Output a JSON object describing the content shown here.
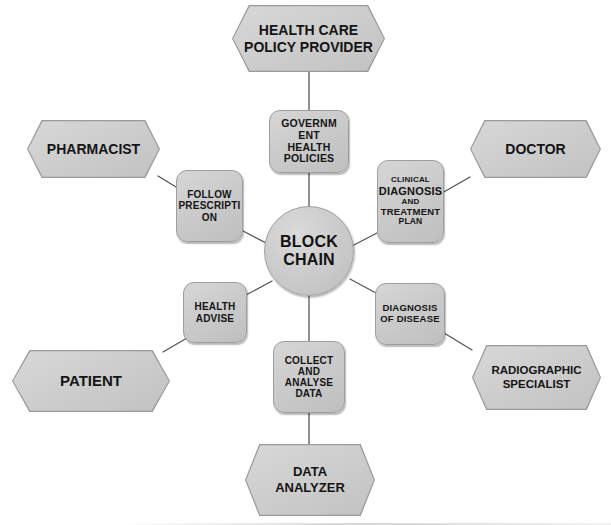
{
  "diagram": {
    "center": {
      "id": "block-chain",
      "label_line1": "BLOCK",
      "label_line2": "CHAIN"
    },
    "colors": {
      "shape_fill": "#cccccc",
      "shape_border": "#9e9e9e",
      "text": "#141414",
      "connector": "#555555",
      "background": "#ffffff"
    },
    "actors": [
      {
        "id": "health-care-policy-provider",
        "label_line1": "HEALTH CARE",
        "label_line2": "POLICY PROVIDER"
      },
      {
        "id": "pharmacist",
        "label_line1": "PHARMACIST",
        "label_line2": ""
      },
      {
        "id": "doctor",
        "label_line1": "DOCTOR",
        "label_line2": ""
      },
      {
        "id": "patient",
        "label_line1": "PATIENT",
        "label_line2": ""
      },
      {
        "id": "radiographic-specialist",
        "label_line1": "RADIOGRAPHIC",
        "label_line2": "SPECIALIST"
      },
      {
        "id": "data-analyzer",
        "label_line1": "DATA",
        "label_line2": "ANALYZER"
      }
    ],
    "processes": [
      {
        "id": "government-health-policies",
        "lines": [
          "GOVERNM",
          "ENT",
          "HEALTH",
          "POLICIES"
        ]
      },
      {
        "id": "follow-prescription",
        "lines": [
          "FOLLOW",
          "PRESCRIPTI",
          "ON"
        ]
      },
      {
        "id": "clinical-diagnosis-and-treatment-plan",
        "lines": [
          "CLINICAL",
          "DIAGNOSIS",
          "AND",
          "TREATMENT",
          "PLAN"
        ]
      },
      {
        "id": "health-advise",
        "lines": [
          "HEALTH",
          "ADVISE"
        ]
      },
      {
        "id": "diagnosis-of-disease",
        "lines": [
          "DIAGNOSIS",
          "OF DISEASE"
        ]
      },
      {
        "id": "collect-and-analyse-data",
        "lines": [
          "COLLECT",
          "AND",
          "ANALYSE",
          "DATA"
        ]
      }
    ]
  }
}
